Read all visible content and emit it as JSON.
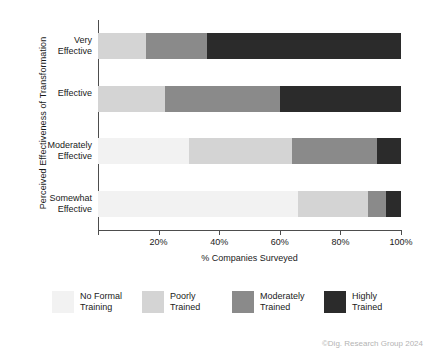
{
  "chart_data": {
    "type": "bar",
    "orientation": "horizontal",
    "stacked": true,
    "normalized_percent": true,
    "title": "",
    "xlabel": "% Companies Surveyed",
    "ylabel": "Perceived Effectiveness of Transformation",
    "xlim": [
      0,
      100
    ],
    "grid": false,
    "legend_position": "bottom",
    "categories": [
      "Very Effective",
      "Effective",
      "Moderately Effective",
      "Somewhat Effective"
    ],
    "xticks": [
      0,
      20,
      40,
      60,
      80,
      100
    ],
    "xticklabels": [
      "",
      "20%",
      "40%",
      "60%",
      "80%",
      "100%"
    ],
    "series": [
      {
        "name": "No Formal Training",
        "color": "#f2f2f2",
        "values": [
          0,
          0,
          30,
          66
        ]
      },
      {
        "name": "Poorly Trained",
        "color": "#d4d4d4",
        "values": [
          16,
          22,
          34,
          23
        ]
      },
      {
        "name": "Moderately Trained",
        "color": "#8a8a8a",
        "values": [
          20,
          38,
          28,
          6
        ]
      },
      {
        "name": "Highly Trained",
        "color": "#2b2b2b",
        "values": [
          64,
          40,
          8,
          5
        ]
      }
    ],
    "cumulative_breaks": [
      [
        0,
        16,
        36,
        100
      ],
      [
        0,
        22,
        60,
        100
      ],
      [
        30,
        64,
        92,
        100
      ],
      [
        66,
        89,
        95,
        100
      ]
    ]
  },
  "footer": {
    "credit": "©Dig. Research Group 2024"
  },
  "axis": {
    "y_title": "Perceived Effectiveness of Transformation",
    "x_title": "% Companies Surveyed"
  }
}
